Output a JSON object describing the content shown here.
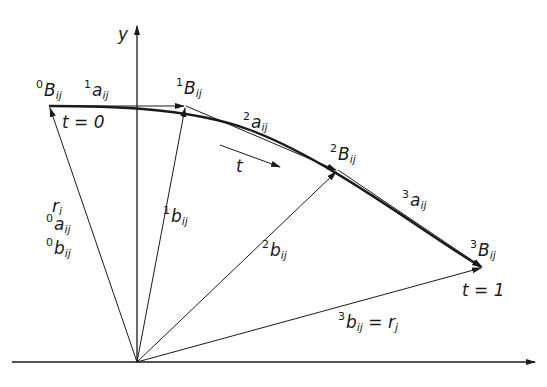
{
  "diagram": {
    "axis_y_label": "y",
    "labels": {
      "B0": {
        "sup": "0",
        "base": "B",
        "sub": "ij"
      },
      "a1": {
        "sup": "1",
        "base": "a",
        "sub": "ij"
      },
      "B1": {
        "sup": "1",
        "base": "B",
        "sub": "ij"
      },
      "a2": {
        "sup": "2",
        "base": "a",
        "sub": "ij"
      },
      "B2": {
        "sup": "2",
        "base": "B",
        "sub": "ij"
      },
      "a3": {
        "sup": "3",
        "base": "a",
        "sub": "ij"
      },
      "B3": {
        "sup": "3",
        "base": "B",
        "sub": "ij"
      },
      "ri": {
        "base": "r",
        "sub": "i"
      },
      "a0": {
        "sup": "0",
        "base": "a",
        "sub": "ij"
      },
      "b0": {
        "sup": "0",
        "base": "b",
        "sub": "ij"
      },
      "b1": {
        "sup": "1",
        "base": "b",
        "sub": "ij"
      },
      "b2": {
        "sup": "2",
        "base": "b",
        "sub": "ij"
      },
      "b3": {
        "sup": "3",
        "base": "b",
        "sub": "ij",
        "suffix": " = r",
        "suffix_sub": "j"
      },
      "t0": "t = 0",
      "t1": "t = 1",
      "t_dir": "t"
    }
  }
}
